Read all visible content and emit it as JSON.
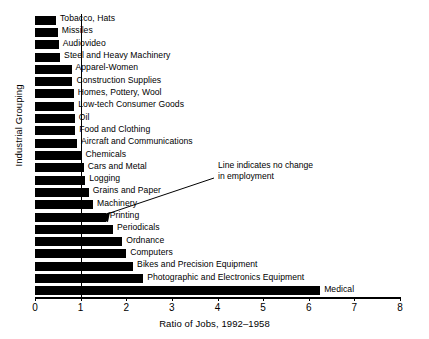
{
  "chart_data": {
    "type": "bar",
    "orientation": "horizontal",
    "title": "",
    "xlabel": "Ratio  of Jobs, 1992–1958",
    "ylabel": "Industrial Grouping",
    "xlim": [
      0,
      8
    ],
    "xticks": [
      0,
      1,
      2,
      3,
      4,
      5,
      6,
      7,
      8
    ],
    "xticklabels": [
      "0",
      "1",
      "2",
      "3",
      "4",
      "5",
      "6",
      "7",
      "8"
    ],
    "grid": false,
    "legend": null,
    "reference_line": {
      "value": 1,
      "orientation": "vertical",
      "annotation": "Line indicates no change in employment",
      "annotation_line_1": "Line indicates no change",
      "annotation_line_2": "in employment"
    },
    "categories": [
      "Tobacco, Hats",
      "Missiles",
      "Audiovideo",
      "Steel and Heavy Machinery",
      "Apparel-Women",
      "Construction Supplies",
      "Homes, Pottery, Wool",
      "Low-tech Consumer Goods",
      "Oil",
      "Food and Clothing",
      "Aircraft and Communications",
      "Chemicals",
      "Cars and Metal",
      "Logging",
      "Grains and Paper",
      "Machinery",
      "Printing",
      "Periodicals",
      "Ordnance",
      "Computers",
      "Bikes and Precision Equipment",
      "Photographic and Electronics Equipment",
      "Medical"
    ],
    "values": [
      0.46,
      0.5,
      0.52,
      0.55,
      0.8,
      0.82,
      0.85,
      0.86,
      0.87,
      0.88,
      0.92,
      1.02,
      1.07,
      1.1,
      1.18,
      1.27,
      1.55,
      1.71,
      1.91,
      2.0,
      2.15,
      2.37,
      6.25
    ],
    "bar_color": "#000000"
  }
}
